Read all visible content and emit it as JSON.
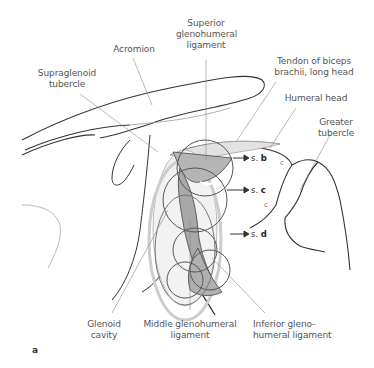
{
  "figure": {
    "panel_label": "a",
    "labels": {
      "superior_ligament": [
        "Superior",
        "glenohumeral",
        "ligament"
      ],
      "acromion": [
        "Acromion"
      ],
      "supraglenoid_tubercle": [
        "Supraglenoid",
        "tubercle"
      ],
      "biceps_tendon": [
        "Tendon of biceps",
        "brachii, long head"
      ],
      "humeral_head": [
        "Humeral head"
      ],
      "greater_tubercle": [
        "Greater",
        "tubercle"
      ],
      "glenoid_cavity": [
        "Glenoid",
        "cavity"
      ],
      "middle_ligament": [
        "Middle glenohumeral",
        "ligament"
      ],
      "inferior_ligament": [
        "Inferior gleno-",
        "humeral ligament"
      ]
    },
    "section_refs": [
      {
        "prefix": "s.",
        "letter": "b"
      },
      {
        "prefix": "s.",
        "letter": "c"
      },
      {
        "prefix": "s.",
        "letter": "d"
      }
    ],
    "small_marks": [
      "c",
      "c"
    ],
    "colors": {
      "outline": "#333333",
      "leader": "#888888",
      "ligament_fill": "#b5b5b5",
      "ligament_dark": "#9a9a9a",
      "circle_stroke": "#555555",
      "label_text": "#555555"
    }
  }
}
